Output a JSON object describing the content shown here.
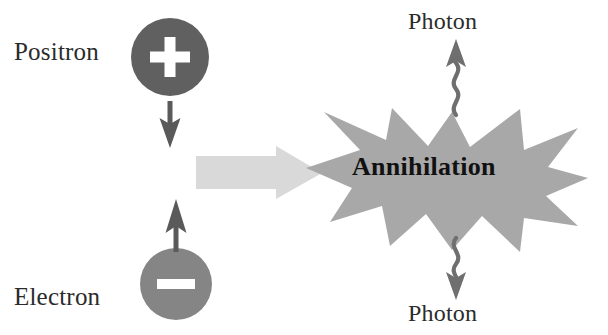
{
  "figure": {
    "background_color": "#ffffff"
  },
  "particles": [
    {
      "name": "positron",
      "label": "Positron",
      "charge_symbol": "+",
      "fill_color": "#606060",
      "symbol_color": "#ffffff",
      "motion": "down"
    },
    {
      "name": "electron",
      "label": "Electron",
      "charge_symbol": "−",
      "fill_color": "#858585",
      "symbol_color": "#ffffff",
      "motion": "up"
    }
  ],
  "process_arrow": {
    "name": "process-arrow",
    "direction": "right",
    "fill_color": "#d9d9d9"
  },
  "burst": {
    "label": "Annihilation",
    "fill_color": "#a8a8a8",
    "text_color": "#111111"
  },
  "photons": [
    {
      "name": "photon-top",
      "label": "Photon",
      "direction": "up",
      "stroke_color": "#6f6f6f"
    },
    {
      "name": "photon-bottom",
      "label": "Photon",
      "direction": "down",
      "stroke_color": "#6f6f6f"
    }
  ],
  "motion_arrows": [
    {
      "name": "positron-motion-arrow",
      "direction": "down",
      "color": "#5a5a5a"
    },
    {
      "name": "electron-motion-arrow",
      "direction": "up",
      "color": "#5a5a5a"
    }
  ]
}
